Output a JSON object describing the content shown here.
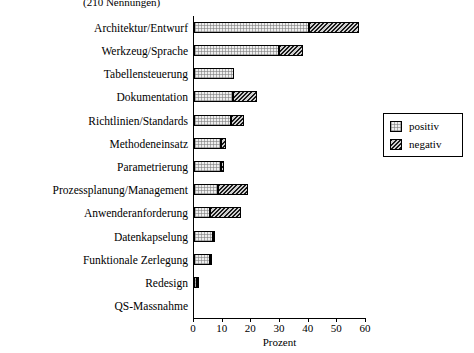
{
  "chart_data": {
    "type": "bar",
    "orientation": "horizontal",
    "stacked": true,
    "title": "",
    "subtitle": "(210 Nennungen)",
    "xlabel": "Prozent",
    "ylabel": "",
    "xlim": [
      0,
      60
    ],
    "xticks": [
      0,
      10,
      20,
      30,
      40,
      50,
      60
    ],
    "xtick_labels": [
      "0",
      "10",
      "20",
      "30",
      "40",
      "50",
      "60"
    ],
    "grid": false,
    "legend": {
      "position": "right",
      "entries": [
        {
          "name": "positiv",
          "fill": "light-crosshatch"
        },
        {
          "name": "negativ",
          "fill": "dark-diagonal-hatch"
        }
      ]
    },
    "categories": [
      "Architektur/Entwurf",
      "Werkzeug/Sprache",
      "Tabellensteuerung",
      "Dokumentation",
      "Richtlinien/Standards",
      "Methodeneinsatz",
      "Parametrierung",
      "Prozessplanung/Management",
      "Anwenderanforderung",
      "Datenkapselung",
      "Funktionale Zerlegung",
      "Redesign",
      "QS-Massnahme"
    ],
    "series": [
      {
        "name": "positiv",
        "values": [
          40.0,
          29.5,
          14.0,
          13.5,
          13.0,
          9.5,
          9.5,
          8.5,
          5.5,
          6.5,
          5.5,
          1.0,
          0.0
        ]
      },
      {
        "name": "negativ",
        "values": [
          17.5,
          8.5,
          0.0,
          8.5,
          4.5,
          1.5,
          1.0,
          10.5,
          11.0,
          1.0,
          0.5,
          0.5,
          0.0
        ]
      }
    ],
    "totals": [
      57.5,
      38.0,
      14.0,
      22.0,
      17.5,
      11.0,
      10.5,
      19.0,
      16.5,
      7.5,
      6.0,
      1.5,
      0.0
    ]
  }
}
